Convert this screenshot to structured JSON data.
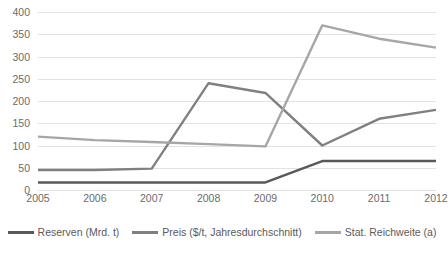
{
  "chart_data": {
    "type": "line",
    "title": "",
    "subtitle": "",
    "xlabel": "",
    "ylabel": "",
    "categories": [
      "2005",
      "2006",
      "2007",
      "2008",
      "2009",
      "2010",
      "2011",
      "2012"
    ],
    "x": [
      2005,
      2006,
      2007,
      2008,
      2009,
      2010,
      2011,
      2012
    ],
    "ylim": [
      0,
      400
    ],
    "yticks": [
      0,
      50,
      100,
      150,
      200,
      250,
      300,
      350,
      400
    ],
    "ytick_labels": [
      "0",
      "50",
      "100",
      "150",
      "200",
      "250",
      "300",
      "350",
      "400"
    ],
    "grid": true,
    "grid_axis": "y",
    "legend_position": "bottom",
    "series": [
      {
        "name": "Reserven (Mrd. t)",
        "color": "#595959",
        "values": [
          17,
          17,
          17,
          17,
          17,
          65,
          65,
          65
        ]
      },
      {
        "name": "Preis ($/t, Jahresdurchschnitt)",
        "color": "#808080",
        "values": [
          45,
          45,
          48,
          240,
          218,
          100,
          160,
          180
        ]
      },
      {
        "name": "Stat. Reichweite (a)",
        "color": "#a6a6a6",
        "values": [
          120,
          112,
          108,
          103,
          98,
          370,
          340,
          320
        ]
      }
    ]
  },
  "legend": {
    "items": [
      {
        "label": "Reserven (Mrd. t)",
        "color": "#595959"
      },
      {
        "label": "Preis ($/t, Jahresdurchschnitt)",
        "color": "#808080"
      },
      {
        "label": "Stat. Reichweite (a)",
        "color": "#a6a6a6"
      }
    ]
  },
  "colors": {
    "gridline": "#e2e2e2",
    "axis_text": "#6b6b6b",
    "background": "#ffffff"
  }
}
